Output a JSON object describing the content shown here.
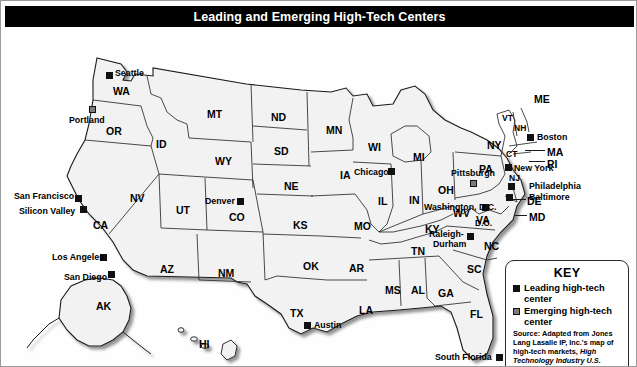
{
  "title": "Leading and Emerging High-Tech Centers",
  "map": {
    "region_name": "United States",
    "states": [
      {
        "abbr": "WA",
        "x": 112,
        "y": 58
      },
      {
        "abbr": "OR",
        "x": 105,
        "y": 98
      },
      {
        "abbr": "ID",
        "x": 155,
        "y": 111
      },
      {
        "abbr": "MT",
        "x": 206,
        "y": 81
      },
      {
        "abbr": "ND",
        "x": 270,
        "y": 84
      },
      {
        "abbr": "SD",
        "x": 273,
        "y": 118
      },
      {
        "abbr": "NE",
        "x": 283,
        "y": 153
      },
      {
        "abbr": "WY",
        "x": 214,
        "y": 128
      },
      {
        "abbr": "NV",
        "x": 129,
        "y": 165
      },
      {
        "abbr": "UT",
        "x": 175,
        "y": 177
      },
      {
        "abbr": "CA",
        "x": 92,
        "y": 192
      },
      {
        "abbr": "CO",
        "x": 228,
        "y": 184
      },
      {
        "abbr": "AZ",
        "x": 159,
        "y": 236
      },
      {
        "abbr": "NM",
        "x": 217,
        "y": 240
      },
      {
        "abbr": "KS",
        "x": 292,
        "y": 192
      },
      {
        "abbr": "OK",
        "x": 302,
        "y": 233
      },
      {
        "abbr": "TX",
        "x": 289,
        "y": 280
      },
      {
        "abbr": "MN",
        "x": 325,
        "y": 97
      },
      {
        "abbr": "IA",
        "x": 339,
        "y": 142
      },
      {
        "abbr": "MO",
        "x": 353,
        "y": 193
      },
      {
        "abbr": "AR",
        "x": 348,
        "y": 235
      },
      {
        "abbr": "LA",
        "x": 358,
        "y": 277
      },
      {
        "abbr": "WI",
        "x": 367,
        "y": 114
      },
      {
        "abbr": "IL",
        "x": 377,
        "y": 168
      },
      {
        "abbr": "MS",
        "x": 384,
        "y": 257
      },
      {
        "abbr": "AL",
        "x": 410,
        "y": 257
      },
      {
        "abbr": "MI",
        "x": 412,
        "y": 124
      },
      {
        "abbr": "IN",
        "x": 408,
        "y": 167
      },
      {
        "abbr": "OH",
        "x": 437,
        "y": 157
      },
      {
        "abbr": "KY",
        "x": 424,
        "y": 196
      },
      {
        "abbr": "TN",
        "x": 410,
        "y": 218
      },
      {
        "abbr": "GA",
        "x": 437,
        "y": 260
      },
      {
        "abbr": "FL",
        "x": 469,
        "y": 308
      },
      {
        "abbr": "SC",
        "x": 466,
        "y": 236
      },
      {
        "abbr": "NC",
        "x": 483,
        "y": 213
      },
      {
        "abbr": "VA",
        "x": 475,
        "y": 187
      },
      {
        "abbr": "WV",
        "x": 458,
        "y": 180
      },
      {
        "abbr": "PA",
        "x": 482,
        "y": 136
      },
      {
        "abbr": "NY",
        "x": 496,
        "y": 112
      },
      {
        "abbr": "VT",
        "x": 507,
        "y": 89
      },
      {
        "abbr": "NH",
        "x": 521,
        "y": 97
      },
      {
        "abbr": "ME",
        "x": 535,
        "y": 69
      },
      {
        "abbr": "MA",
        "x": 546,
        "y": 119
      },
      {
        "abbr": "CT",
        "x": 513,
        "y": 124
      },
      {
        "abbr": "RI",
        "x": 546,
        "y": 130
      },
      {
        "abbr": "NJ",
        "x": 512,
        "y": 147
      },
      {
        "abbr": "DE",
        "x": 530,
        "y": 172
      },
      {
        "abbr": "MD",
        "x": 533,
        "y": 187
      },
      {
        "abbr": "D.C.",
        "x": 482,
        "y": 193
      },
      {
        "abbr": "AK",
        "x": 103,
        "y": 265
      },
      {
        "abbr": "HI",
        "x": 203,
        "y": 331
      }
    ],
    "cities": [
      {
        "name": "Seattle",
        "type": "leading",
        "mx": 105,
        "my": 44,
        "lx": 114,
        "ly": 41,
        "anchor": "left"
      },
      {
        "name": "Portland",
        "type": "emerging",
        "mx": 88,
        "my": 78,
        "lx": 90,
        "ly": 88,
        "anchor": "left"
      },
      {
        "name": "San Francisco",
        "type": "leading",
        "mx": 74,
        "my": 167,
        "lx": 16,
        "ly": 164,
        "anchor": "left"
      },
      {
        "name": "Silicon Valley",
        "type": "leading",
        "mx": 79,
        "my": 178,
        "lx": 20,
        "ly": 179,
        "anchor": "left"
      },
      {
        "name": "Los Angeles",
        "type": "leading",
        "mx": 99,
        "my": 226,
        "lx": 55,
        "ly": 226,
        "anchor": "left"
      },
      {
        "name": "San Diego",
        "type": "leading",
        "mx": 107,
        "my": 243,
        "lx": 62,
        "ly": 246,
        "anchor": "left"
      },
      {
        "name": "Denver",
        "type": "leading",
        "mx": 236,
        "my": 170,
        "lx": 204,
        "ly": 169,
        "anchor": "left"
      },
      {
        "name": "Austin",
        "type": "leading",
        "mx": 303,
        "my": 294,
        "lx": 312,
        "ly": 293,
        "anchor": "left"
      },
      {
        "name": "Chicago",
        "type": "leading",
        "mx": 387,
        "my": 142,
        "lx": 355,
        "ly": 142,
        "anchor": "left"
      },
      {
        "name": "Pittsburgh",
        "type": "emerging",
        "mx": 469,
        "my": 152,
        "lx": 453,
        "ly": 142,
        "anchor": "left"
      },
      {
        "name": "New York",
        "type": "leading",
        "mx": 506,
        "my": 138,
        "lx": 512,
        "ly": 137,
        "anchor": "left"
      },
      {
        "name": "Boston",
        "type": "leading",
        "mx": 528,
        "my": 107,
        "lx": 536,
        "ly": 106,
        "anchor": "left"
      },
      {
        "name": "Philadelphia",
        "type": "leading",
        "mx": 508,
        "my": 155,
        "lx": 516,
        "ly": 155,
        "anchor": "left"
      },
      {
        "name": "Baltimore",
        "type": "leading",
        "mx": 506,
        "my": 166,
        "lx": 516,
        "ly": 165,
        "anchor": "left"
      },
      {
        "name": "Washington, D.C.",
        "type": "leading",
        "mx": 481,
        "my": 176,
        "lx": 442,
        "ly": 174,
        "anchor": "left"
      },
      {
        "name": "Raleigh-",
        "type": "leading",
        "mx": 466,
        "my": 207,
        "lx": 432,
        "ly": 203,
        "anchor": "left"
      },
      {
        "name": "Durham",
        "type": "none",
        "mx": 0,
        "my": 0,
        "lx": 435,
        "ly": 212,
        "anchor": "left"
      },
      {
        "name": "South Florida",
        "type": "leading",
        "mx": 495,
        "my": 326,
        "lx": 436,
        "ly": 325,
        "anchor": "left"
      }
    ]
  },
  "key": {
    "title": "KEY",
    "items": [
      {
        "type": "leading",
        "label": "Leading high-tech center"
      },
      {
        "type": "emerging",
        "label": "Emerging high-tech center"
      }
    ],
    "source_prefix": "Source: Adapted from Jones Lang Lasalle IP, Inc.'s map of high-tech markets, ",
    "source_italic": "High Technology Industry U.S. Office Outlook, 2011"
  },
  "colors": {
    "leading": "#111111",
    "emerging": "#7d7d7d",
    "title_bar": "#000000",
    "state_fill": "#f2f2f2",
    "state_stroke": "#1a1a1a"
  }
}
